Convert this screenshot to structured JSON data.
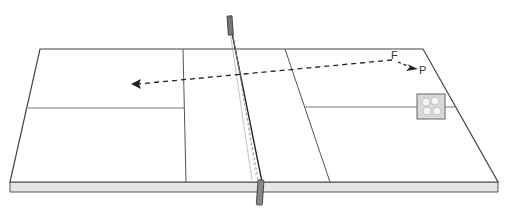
{
  "diagram": {
    "type": "court-perspective",
    "labels": {
      "start": "F",
      "end": "P"
    },
    "colors": {
      "line": "#444444",
      "court_fill": "#ffffff",
      "edge_fill": "#e6e6e6",
      "post": "#777777",
      "dash": "#222222"
    },
    "elements": [
      "court",
      "net",
      "net-posts",
      "trajectory-arrow",
      "target-marker"
    ]
  }
}
